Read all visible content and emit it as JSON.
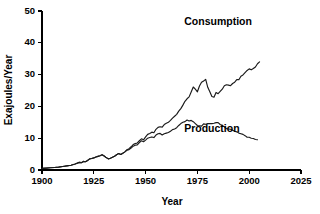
{
  "chart_data": {
    "type": "line",
    "title": "",
    "xlabel": "Year",
    "ylabel": "Exajoules/Year",
    "xlim": [
      1900,
      2025
    ],
    "ylim": [
      0,
      50
    ],
    "grid": false,
    "legend_position": "inline-annotations",
    "xticks": [
      1900,
      1925,
      1950,
      1975,
      2000,
      2025
    ],
    "yticks": [
      0,
      10,
      20,
      30,
      40,
      50
    ],
    "xtick_labels": [
      "1900",
      "1925",
      "1950",
      "1975",
      "2000",
      "2025"
    ],
    "ytick_labels": [
      "0",
      "10",
      "20",
      "30",
      "40",
      "50"
    ],
    "series": [
      {
        "name": "Consumption",
        "label": "Consumption",
        "color": "#1a1a1a",
        "x": [
          1900,
          1902,
          1904,
          1906,
          1908,
          1910,
          1912,
          1914,
          1916,
          1918,
          1919,
          1920,
          1921,
          1922,
          1923,
          1924,
          1925,
          1926,
          1927,
          1928,
          1929,
          1930,
          1931,
          1932,
          1933,
          1934,
          1935,
          1936,
          1937,
          1938,
          1939,
          1940,
          1941,
          1942,
          1943,
          1944,
          1945,
          1946,
          1947,
          1948,
          1949,
          1950,
          1951,
          1952,
          1953,
          1954,
          1955,
          1956,
          1957,
          1958,
          1959,
          1960,
          1961,
          1962,
          1963,
          1964,
          1965,
          1966,
          1967,
          1968,
          1969,
          1970,
          1971,
          1972,
          1973,
          1974,
          1975,
          1976,
          1977,
          1978,
          1979,
          1980,
          1981,
          1982,
          1983,
          1984,
          1985,
          1986,
          1987,
          1988,
          1989,
          1990,
          1991,
          1992,
          1993,
          1994,
          1995,
          1996,
          1997,
          1998,
          1999,
          2000,
          2001,
          2002,
          2003,
          2004,
          2005
        ],
        "values": [
          0.5,
          0.6,
          0.7,
          0.8,
          0.9,
          1.1,
          1.3,
          1.5,
          1.9,
          2.4,
          2.3,
          2.7,
          2.6,
          3.0,
          3.5,
          3.6,
          3.8,
          4.1,
          4.3,
          4.5,
          4.8,
          4.4,
          3.9,
          3.5,
          3.7,
          4.0,
          4.3,
          4.8,
          5.2,
          4.9,
          5.3,
          5.7,
          6.4,
          6.7,
          7.3,
          8.0,
          8.3,
          8.5,
          9.2,
          9.8,
          9.5,
          10.4,
          11.2,
          11.5,
          11.9,
          11.7,
          12.8,
          13.4,
          13.6,
          13.5,
          14.3,
          14.7,
          15.0,
          15.6,
          16.3,
          16.9,
          17.5,
          18.5,
          19.3,
          20.4,
          21.6,
          22.4,
          23.0,
          24.5,
          26.1,
          25.4,
          24.6,
          26.4,
          27.6,
          28.0,
          28.5,
          26.0,
          24.6,
          23.1,
          22.9,
          24.4,
          24.0,
          24.7,
          25.4,
          26.5,
          26.8,
          26.7,
          26.5,
          27.2,
          27.6,
          28.4,
          28.4,
          29.5,
          29.9,
          30.6,
          31.3,
          31.8,
          31.5,
          31.9,
          32.4,
          33.4,
          34.0
        ]
      },
      {
        "name": "Production",
        "label": "Production",
        "color": "#1a1a1a",
        "x": [
          1900,
          1902,
          1904,
          1906,
          1908,
          1910,
          1912,
          1914,
          1916,
          1918,
          1919,
          1920,
          1921,
          1922,
          1923,
          1924,
          1925,
          1926,
          1927,
          1928,
          1929,
          1930,
          1931,
          1932,
          1933,
          1934,
          1935,
          1936,
          1937,
          1938,
          1939,
          1940,
          1941,
          1942,
          1943,
          1944,
          1945,
          1946,
          1947,
          1948,
          1949,
          1950,
          1951,
          1952,
          1953,
          1954,
          1955,
          1956,
          1957,
          1958,
          1959,
          1960,
          1961,
          1962,
          1963,
          1964,
          1965,
          1966,
          1967,
          1968,
          1969,
          1970,
          1971,
          1972,
          1973,
          1974,
          1975,
          1976,
          1977,
          1978,
          1979,
          1980,
          1981,
          1982,
          1983,
          1984,
          1985,
          1986,
          1987,
          1988,
          1989,
          1990,
          1991,
          1992,
          1993,
          1994,
          1995,
          1996,
          1997,
          1998,
          1999,
          2000,
          2001,
          2002,
          2003,
          2004
        ],
        "values": [
          0.5,
          0.6,
          0.7,
          0.8,
          0.9,
          1.1,
          1.3,
          1.5,
          1.9,
          2.4,
          2.3,
          2.7,
          2.6,
          3.0,
          3.5,
          3.6,
          3.8,
          4.1,
          4.3,
          4.5,
          4.8,
          4.4,
          3.9,
          3.5,
          3.7,
          4.0,
          4.3,
          4.8,
          5.2,
          4.9,
          5.3,
          5.7,
          6.2,
          6.4,
          6.9,
          7.5,
          7.8,
          7.9,
          8.6,
          9.2,
          8.9,
          9.4,
          10.0,
          10.2,
          10.4,
          10.2,
          11.0,
          11.4,
          11.5,
          11.0,
          11.4,
          11.6,
          11.8,
          12.2,
          12.7,
          12.9,
          13.3,
          14.0,
          14.6,
          15.0,
          15.2,
          15.7,
          15.4,
          15.6,
          15.2,
          14.6,
          14.0,
          13.9,
          13.8,
          14.5,
          14.4,
          14.6,
          14.6,
          14.6,
          14.7,
          14.9,
          14.9,
          14.3,
          14.0,
          13.6,
          13.0,
          12.9,
          12.8,
          12.5,
          12.2,
          12.0,
          11.6,
          11.4,
          11.2,
          10.8,
          10.3,
          10.3,
          10.0,
          9.9,
          9.6,
          9.5
        ]
      }
    ],
    "annotations": [
      {
        "text": "Consumption",
        "x_value": 1985,
        "y_value": 45.5
      },
      {
        "text": "Production",
        "x_value": 1982,
        "y_value": 12.0
      }
    ]
  }
}
